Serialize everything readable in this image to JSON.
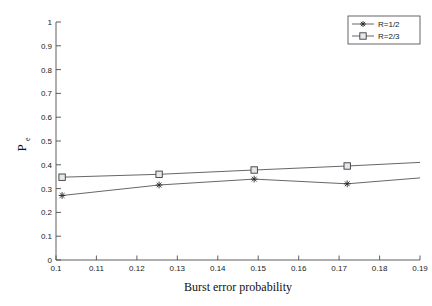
{
  "figure": {
    "background_color": "#ffffff",
    "axes_color": "#4d4d4d",
    "line_color": "#55555a"
  },
  "chart_data": {
    "type": "line",
    "title": "",
    "xlabel": "Burst error probability",
    "ylabel": "P_e",
    "ylabel_main": "P",
    "ylabel_sub": "e",
    "xlim": [
      0.1,
      0.19
    ],
    "ylim": [
      0,
      1
    ],
    "xticks": [
      0.1,
      0.11,
      0.12,
      0.13,
      0.14,
      0.15,
      0.16,
      0.17,
      0.18,
      0.19
    ],
    "yticks": [
      0,
      0.1,
      0.2,
      0.3,
      0.4,
      0.5,
      0.6,
      0.7,
      0.8,
      0.9,
      1
    ],
    "xticklabels": [
      "0.1",
      "0.11",
      "0.12",
      "0.13",
      "0.14",
      "0.15",
      "0.16",
      "0.17",
      "0.18",
      "0.19"
    ],
    "yticklabels": [
      "0",
      "0.1",
      "0.2",
      "0.3",
      "0.4",
      "0.5",
      "0.6",
      "0.7",
      "0.8",
      "0.9",
      "1"
    ],
    "grid": false,
    "legend_position": "upper right",
    "series": [
      {
        "name": "R=1/2",
        "marker": "star",
        "x": [
          0.1015,
          0.1255,
          0.149,
          0.172,
          0.19
        ],
        "y": [
          0.271,
          0.315,
          0.34,
          0.32,
          0.345
        ]
      },
      {
        "name": "R=2/3",
        "marker": "square",
        "x": [
          0.1015,
          0.1255,
          0.149,
          0.172,
          0.19
        ],
        "y": [
          0.348,
          0.36,
          0.378,
          0.395,
          0.41
        ]
      }
    ]
  },
  "legend": {
    "entries": [
      {
        "label": "R=1/2",
        "marker": "star"
      },
      {
        "label": "R=2/3",
        "marker": "square"
      }
    ]
  }
}
